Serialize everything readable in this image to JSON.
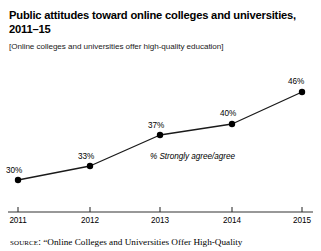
{
  "figure": {
    "title": "Public attitudes toward online colleges and universities,\n2011–15",
    "subtitle": "[Online colleges and universities offer high-quality education]",
    "source_label": "source:",
    "source_text": "“Online Colleges and Universities Offer High-Quality"
  },
  "chart_data": {
    "type": "line",
    "title": "Public attitudes toward online colleges and universities, 2011–15",
    "subtitle": "[Online colleges and universities offer high-quality education]",
    "categories": [
      "2011",
      "2012",
      "2013",
      "2014",
      "2015"
    ],
    "values": [
      30,
      33,
      37,
      40,
      46
    ],
    "value_labels": [
      "30%",
      "33%",
      "37%",
      "40%",
      "46%"
    ],
    "series_name": "% Strongly agree/agree",
    "xlabel": "",
    "ylabel": "",
    "ylim": [
      0,
      50
    ],
    "grid": false,
    "legend": "none",
    "annotation": "% Strongly agree/agree",
    "line_color": "#1a1a1a",
    "marker_color": "#000000",
    "axis_color": "#333333"
  },
  "points": [
    {
      "label": "30%",
      "year": "2011",
      "px": 18,
      "py": 180,
      "lx": 6,
      "ly": 166,
      "tx": 18
    },
    {
      "label": "33%",
      "year": "2012",
      "px": 90,
      "py": 166,
      "lx": 78,
      "ly": 152,
      "tx": 90
    },
    {
      "label": "37%",
      "year": "2013",
      "px": 160,
      "py": 135,
      "lx": 148,
      "ly": 121,
      "tx": 160
    },
    {
      "label": "40%",
      "year": "2014",
      "px": 232,
      "py": 124,
      "lx": 220,
      "ly": 109,
      "tx": 232
    },
    {
      "label": "46%",
      "year": "2015",
      "px": 302,
      "py": 92,
      "lx": 288,
      "ly": 77,
      "tx": 302
    }
  ],
  "annotation_position": {
    "x": 150,
    "y": 152
  },
  "axis": {
    "y": 212,
    "x_start": 8,
    "x_end": 313,
    "tick_height": 5,
    "label_y": 216
  }
}
